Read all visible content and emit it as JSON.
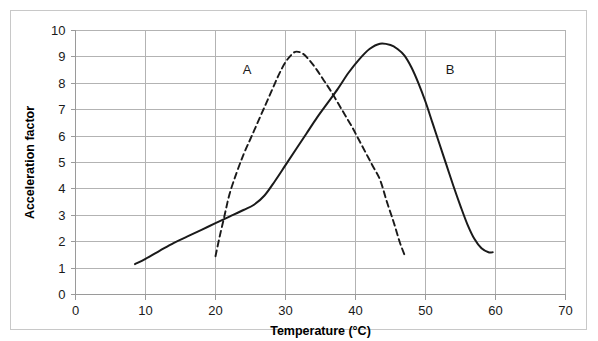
{
  "chart_data": {
    "type": "line",
    "title": "",
    "subtitle": "",
    "xlabel": "Temperature (°C)",
    "ylabel": "Acceleration factor",
    "xlim": [
      0,
      70
    ],
    "ylim": [
      0,
      10
    ],
    "xticks": [
      0,
      10,
      20,
      30,
      40,
      50,
      60,
      70
    ],
    "xtick_labels": [
      "0",
      "10",
      "20",
      "30",
      "40",
      "50",
      "60",
      "70"
    ],
    "yticks": [
      0,
      1,
      2,
      3,
      4,
      5,
      6,
      7,
      8,
      9,
      10
    ],
    "ytick_labels": [
      "0",
      "1",
      "2",
      "3",
      "4",
      "5",
      "6",
      "7",
      "8",
      "9",
      "10"
    ],
    "grid": {
      "horizontal": true,
      "vertical": true,
      "color": "#b3b3b3"
    },
    "legend": {
      "position": "inline-annotation",
      "entries": [
        "A",
        "B"
      ]
    },
    "annotations": [
      {
        "text": "A",
        "x": 24.5,
        "y": 8.35
      },
      {
        "text": "B",
        "x": 53.5,
        "y": 8.35
      }
    ],
    "series": [
      {
        "name": "A",
        "style": "dashed",
        "color": "#1a1a1a",
        "peak": {
          "x": 31.5,
          "y": 9.2
        },
        "points": [
          [
            20.0,
            1.45
          ],
          [
            20.6,
            2.2
          ],
          [
            21.3,
            3.0
          ],
          [
            22.0,
            3.8
          ],
          [
            23.0,
            4.6
          ],
          [
            24.0,
            5.3
          ],
          [
            25.0,
            5.9
          ],
          [
            26.0,
            6.5
          ],
          [
            27.0,
            7.1
          ],
          [
            28.0,
            7.7
          ],
          [
            29.0,
            8.3
          ],
          [
            30.0,
            8.8
          ],
          [
            31.0,
            9.12
          ],
          [
            31.6,
            9.2
          ],
          [
            32.5,
            9.12
          ],
          [
            33.5,
            8.85
          ],
          [
            34.5,
            8.5
          ],
          [
            35.5,
            8.1
          ],
          [
            36.5,
            7.7
          ],
          [
            37.5,
            7.25
          ],
          [
            38.5,
            6.8
          ],
          [
            39.5,
            6.35
          ],
          [
            40.5,
            5.85
          ],
          [
            41.5,
            5.35
          ],
          [
            42.5,
            4.85
          ],
          [
            43.5,
            4.35
          ],
          [
            44.5,
            3.5
          ],
          [
            45.5,
            2.7
          ],
          [
            46.3,
            2.0
          ],
          [
            47.0,
            1.5
          ]
        ]
      },
      {
        "name": "B",
        "style": "solid",
        "color": "#1a1a1a",
        "peak": {
          "x": 43.5,
          "y": 9.5
        },
        "points": [
          [
            8.5,
            1.15
          ],
          [
            10.0,
            1.35
          ],
          [
            12.0,
            1.65
          ],
          [
            14.0,
            1.95
          ],
          [
            16.0,
            2.2
          ],
          [
            18.0,
            2.45
          ],
          [
            20.0,
            2.7
          ],
          [
            22.0,
            2.95
          ],
          [
            24.0,
            3.2
          ],
          [
            25.5,
            3.4
          ],
          [
            27.0,
            3.75
          ],
          [
            28.5,
            4.3
          ],
          [
            30.0,
            4.9
          ],
          [
            31.5,
            5.5
          ],
          [
            33.0,
            6.1
          ],
          [
            34.5,
            6.7
          ],
          [
            36.0,
            7.25
          ],
          [
            37.5,
            7.8
          ],
          [
            39.0,
            8.4
          ],
          [
            40.5,
            8.9
          ],
          [
            42.0,
            9.3
          ],
          [
            43.5,
            9.5
          ],
          [
            45.0,
            9.45
          ],
          [
            46.0,
            9.3
          ],
          [
            47.0,
            9.05
          ],
          [
            48.0,
            8.6
          ],
          [
            49.0,
            8.0
          ],
          [
            50.0,
            7.3
          ],
          [
            51.0,
            6.5
          ],
          [
            52.0,
            5.7
          ],
          [
            53.0,
            4.9
          ],
          [
            54.0,
            4.1
          ],
          [
            55.0,
            3.35
          ],
          [
            56.0,
            2.65
          ],
          [
            57.0,
            2.1
          ],
          [
            58.0,
            1.75
          ],
          [
            59.0,
            1.6
          ],
          [
            59.6,
            1.6
          ]
        ]
      }
    ]
  }
}
